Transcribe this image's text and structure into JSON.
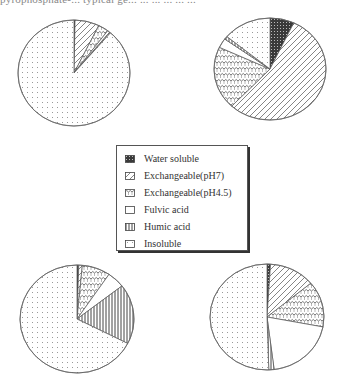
{
  "header": {
    "cut_text": "pyrophosphate-... typical ge... ... ... ... ... ..."
  },
  "legend": {
    "items": [
      {
        "key": "water_soluble",
        "label": "Water soluble",
        "pattern": "dense-dots"
      },
      {
        "key": "exch_ph7",
        "label": "Exchangeable(pH7)",
        "pattern": "diagonal-lines"
      },
      {
        "key": "exch_ph45",
        "label": "Exchangeable(pH4.5)",
        "pattern": "scallops"
      },
      {
        "key": "fulvic",
        "label": "Fulvic acid",
        "pattern": "blank"
      },
      {
        "key": "humic",
        "label": "Humic acid",
        "pattern": "vertical-lines"
      },
      {
        "key": "insoluble",
        "label": "Insoluble",
        "pattern": "sparse-dots"
      }
    ]
  },
  "chart_data": [
    {
      "type": "pie",
      "position": "top-left",
      "center": [
        74,
        73
      ],
      "rx": 56,
      "ry": 53,
      "categories": [
        "Water soluble",
        "Exchangeable(pH7)",
        "Exchangeable(pH4.5)",
        "Fulvic acid",
        "Humic acid",
        "Insoluble"
      ],
      "values": [
        0.3,
        7,
        3,
        0.7,
        0.3,
        88.7
      ]
    },
    {
      "type": "pie",
      "position": "top-right",
      "center": [
        270,
        69
      ],
      "rx": 56,
      "ry": 51,
      "categories": [
        "Water soluble",
        "Exchangeable(pH7)",
        "Exchangeable(pH4.5)",
        "Fulvic acid",
        "Humic acid",
        "Insoluble"
      ],
      "values": [
        7,
        55,
        20,
        3,
        1,
        14
      ]
    },
    {
      "type": "pie",
      "position": "bottom-left",
      "center": [
        77,
        319
      ],
      "rx": 57,
      "ry": 54,
      "categories": [
        "Water soluble",
        "Exchangeable(pH7)",
        "Exchangeable(pH4.5)",
        "Fulvic acid",
        "Humic acid",
        "Insoluble"
      ],
      "values": [
        0.5,
        1,
        8,
        5,
        18,
        67.5
      ]
    },
    {
      "type": "pie",
      "position": "bottom-right",
      "center": [
        267,
        317
      ],
      "rx": 57,
      "ry": 53,
      "categories": [
        "Water soluble",
        "Exchangeable(pH7)",
        "Exchangeable(pH4.5)",
        "Fulvic acid",
        "Humic acid",
        "Insoluble"
      ],
      "values": [
        1,
        13,
        14,
        20,
        1.5,
        50.5
      ]
    }
  ]
}
